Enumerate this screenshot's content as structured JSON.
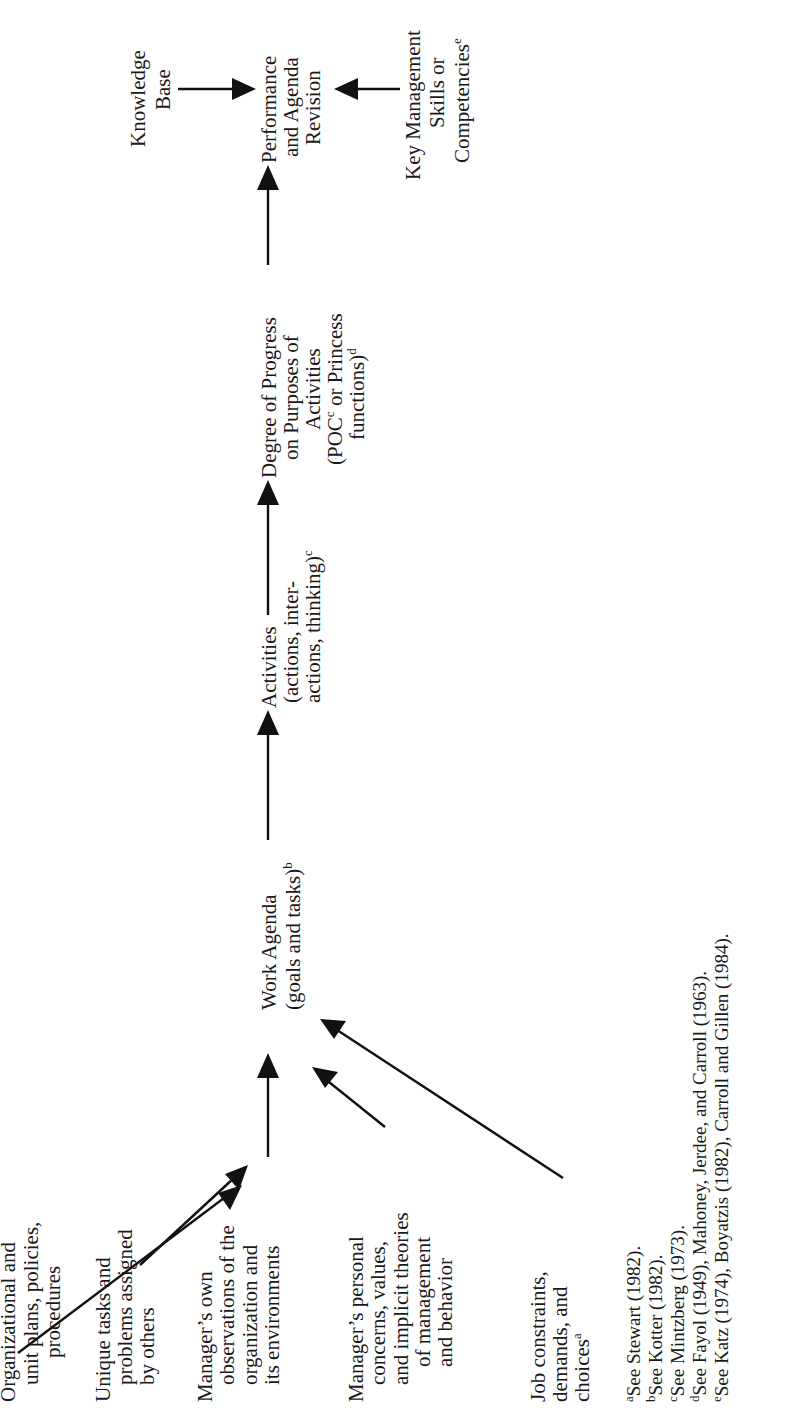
{
  "colors": {
    "background": "#ffffff",
    "ink": "#111111"
  },
  "orientation": "rotated-90-ccw",
  "nodes": {
    "work_agenda": {
      "lines": [
        "Work Agenda",
        "(goals and tasks)"
      ],
      "footnote_ref": "b"
    },
    "activities": {
      "lines": [
        "Activities",
        "(actions, inter-",
        "actions, thinking)"
      ],
      "footnote_ref": "c"
    },
    "degree_of_progress": {
      "lines": [
        "Degree of Progress",
        "on Purposes of",
        "Activities",
        "(POC",
        " or Princess",
        "functions)"
      ],
      "poc_ref": "c",
      "footnote_ref": "d"
    },
    "performance": {
      "lines": [
        "Performance",
        "and Agenda",
        "Revision"
      ]
    },
    "knowledge_base": {
      "lines": [
        "Knowledge",
        "Base"
      ]
    },
    "key_management": {
      "lines": [
        "Key Management",
        "Skills or",
        "Competencies"
      ],
      "footnote_ref": "e"
    }
  },
  "inputs": [
    {
      "id": "org-plans",
      "lines": [
        "Organizational and",
        "unit plans, policies,",
        "procedures"
      ]
    },
    {
      "id": "unique-tasks",
      "lines": [
        "Unique tasks and",
        "problems assigned",
        "by others"
      ]
    },
    {
      "id": "observations",
      "lines": [
        "Manager’s own",
        "observations of the",
        "organization and",
        "its environments"
      ]
    },
    {
      "id": "personal-concerns",
      "lines": [
        "Manager’s personal",
        "concerns, values,",
        "and implicit theories",
        "of management",
        "and behavior"
      ]
    },
    {
      "id": "job-constraints",
      "lines": [
        "Job constraints,",
        "demands, and",
        "choices"
      ],
      "footnote_ref": "a"
    }
  ],
  "flow": [
    "Inputs → Work Agenda",
    "Work Agenda → Activities",
    "Activities → Degree of Progress",
    "Degree of Progress → Performance and Agenda Revision",
    "Knowledge Base → Performance and Agenda Revision",
    "Key Management Skills or Competencies → Performance and Agenda Revision"
  ],
  "footnotes": [
    {
      "mark": "a",
      "text": "See Stewart (1982)."
    },
    {
      "mark": "b",
      "text": "See Kotter (1982)."
    },
    {
      "mark": "c",
      "text": "See Mintzberg (1973)."
    },
    {
      "mark": "d",
      "text": "See Fayol (1949), Mahoney, Jerdee, and Carroll (1963)."
    },
    {
      "mark": "e",
      "text": "See Katz (1974), Boyatzis (1982), Carroll and Gillen (1984)."
    }
  ]
}
